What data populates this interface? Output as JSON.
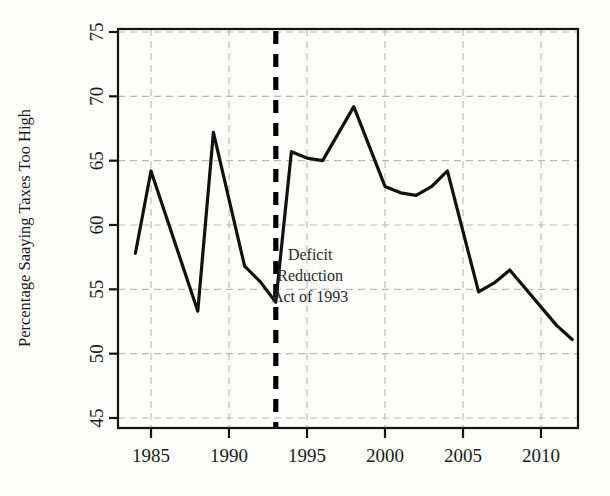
{
  "chart_data": {
    "type": "line",
    "title": "",
    "xlabel": "",
    "ylabel": "Percentage Saaying Taxes Too High",
    "xlim": [
      1983.4,
      1912.0
    ],
    "ylim": [
      44.0,
      76.2
    ],
    "xticks": [
      1985,
      1990,
      1995,
      2000,
      2005,
      2010
    ],
    "yticks": [
      45,
      50,
      55,
      60,
      65,
      70,
      75
    ],
    "xtick_labels": [
      "1985",
      "1990",
      "1995",
      "2000",
      "2005",
      "2010"
    ],
    "ytick_labels": [
      "45",
      "50",
      "55",
      "60",
      "65",
      "70",
      "75"
    ],
    "grid": true,
    "legend": "none",
    "series": [
      {
        "name": "Percentage Saying Taxes Too High",
        "x": [
          1984,
          1985,
          1988,
          1989,
          1991,
          1992,
          1993,
          1994,
          1995,
          1996,
          1998,
          2000,
          2001,
          2002,
          2003,
          2004,
          2006,
          2007,
          2008,
          2011,
          2012
        ],
        "values": [
          57.8,
          64.2,
          53.3,
          67.2,
          56.8,
          55.6,
          54.0,
          65.7,
          65.2,
          65.0,
          69.2,
          63.0,
          62.5,
          62.3,
          63.0,
          64.2,
          54.8,
          55.5,
          56.5,
          52.2,
          51.1
        ]
      }
    ],
    "annotations": [
      {
        "name": "deficit-reduction-marker",
        "type": "vline",
        "x": 1993,
        "style": "dashed",
        "color": "#000000"
      },
      {
        "name": "deficit-reduction-label",
        "type": "text",
        "x": 1995.2,
        "y": 57.3,
        "lines": [
          "Deficit",
          "Reduction",
          "Act of 1993"
        ]
      }
    ],
    "colors": {
      "line": "#111111",
      "grid": "#b9b9b9",
      "axis": "#111111",
      "background": "#fdfdfb",
      "text": "#1a1a1a"
    }
  }
}
